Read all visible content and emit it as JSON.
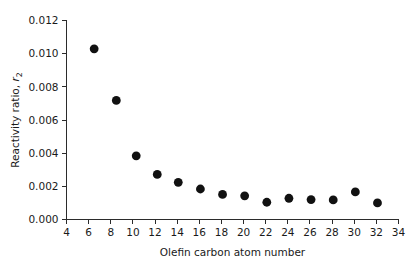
{
  "chart_data": {
    "type": "scatter",
    "title": "",
    "subtitle": "",
    "xlabel": "Olefin carbon atom number",
    "ylabel": "Reactivity ratio, r",
    "ylabel_subscript": "2",
    "ylabel_full": "Reactivity ratio, r₂",
    "x": [
      6.5,
      8.5,
      10.3,
      12.2,
      14.1,
      16.1,
      18.1,
      20.1,
      22.1,
      24.1,
      26.1,
      28.1,
      30.1,
      32.1
    ],
    "values": [
      0.01029,
      0.00718,
      0.00384,
      0.00272,
      0.00224,
      0.00184,
      0.00151,
      0.00143,
      0.00104,
      0.00128,
      0.0012,
      0.00118,
      0.00166,
      0.001
    ],
    "points": [
      {
        "x": 6.5,
        "y": 0.01029
      },
      {
        "x": 8.5,
        "y": 0.00718
      },
      {
        "x": 10.3,
        "y": 0.00384
      },
      {
        "x": 12.2,
        "y": 0.00272
      },
      {
        "x": 14.1,
        "y": 0.00224
      },
      {
        "x": 16.1,
        "y": 0.00184
      },
      {
        "x": 18.1,
        "y": 0.00151
      },
      {
        "x": 20.1,
        "y": 0.00143
      },
      {
        "x": 22.1,
        "y": 0.00104
      },
      {
        "x": 24.1,
        "y": 0.00128
      },
      {
        "x": 26.1,
        "y": 0.0012
      },
      {
        "x": 28.1,
        "y": 0.00118
      },
      {
        "x": 30.1,
        "y": 0.00166
      },
      {
        "x": 32.1,
        "y": 0.001
      }
    ],
    "xlim": [
      4,
      34
    ],
    "ylim": [
      0.0,
      0.012
    ],
    "xticks": [
      4,
      6,
      8,
      10,
      12,
      14,
      16,
      18,
      20,
      22,
      24,
      26,
      28,
      30,
      32,
      34
    ],
    "xtick_labels": [
      "4",
      "6",
      "8",
      "10",
      "12",
      "14",
      "16",
      "18",
      "20",
      "22",
      "24",
      "26",
      "28",
      "30",
      "32",
      "34"
    ],
    "yticks": [
      0.0,
      0.002,
      0.004,
      0.006,
      0.008,
      0.01,
      0.012
    ],
    "ytick_labels": [
      "0.000",
      "0.002",
      "0.004",
      "0.006",
      "0.008",
      "0.010",
      "0.012"
    ],
    "grid": false,
    "legend": false,
    "legend_position": "none",
    "marker": "circle",
    "marker_color": "#111111",
    "marker_size": 4.4,
    "axis_color": "#2b2b2b",
    "background_color": "#ffffff"
  }
}
